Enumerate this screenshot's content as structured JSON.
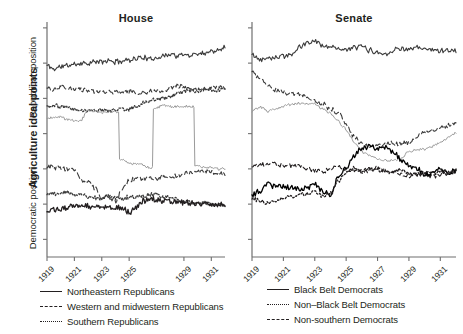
{
  "figure": {
    "y_axis_title": "Agriculture ideal points",
    "y_axis_sub_upper": "Republican position",
    "y_axis_sub_lower": "Democratic position"
  },
  "panels": [
    {
      "id": "house",
      "title": "House",
      "x_tick_labels": [
        "1919",
        "1921",
        "1923",
        "1925",
        "1929",
        "1931"
      ],
      "x_tick_values": [
        1919,
        1921,
        1923,
        1925,
        1929,
        1931
      ]
    },
    {
      "id": "senate",
      "title": "Senate",
      "x_tick_labels": [
        "1919",
        "1921",
        "1923",
        "1925",
        "1927",
        "1929",
        "1931"
      ],
      "x_tick_values": [
        1919,
        1921,
        1923,
        1925,
        1927,
        1929,
        1931
      ]
    }
  ],
  "legends": {
    "left": [
      {
        "label": "Northeastern Republicans",
        "style": "solid",
        "key": "lk-solid"
      },
      {
        "label": "Western and midwestern Republicans",
        "style": "dashed",
        "key": "lk-dashed"
      },
      {
        "label": "Southern Republicans",
        "style": "dotted",
        "key": "lk-dotted"
      }
    ],
    "right": [
      {
        "label": "Black Belt Democrats",
        "style": "solid",
        "key": "lk-solid"
      },
      {
        "label": "Non–Black Belt Democrats",
        "style": "dotted",
        "key": "lk-dotted"
      },
      {
        "label": "Non-southern Democrats",
        "style": "dashed",
        "key": "lk-dashed"
      }
    ]
  },
  "colors": {
    "ink": "#231f20",
    "gray_line": "#9a9a9a",
    "axis": "#6f6f6f",
    "background": "#ffffff"
  },
  "chart_data": {
    "type": "line",
    "title": "Agriculture ideal points",
    "xlabel": "",
    "ylabel": "Agriculture ideal points",
    "grid": false,
    "legend_position": "bottom",
    "xlim": [
      1919,
      1932
    ],
    "ylim": [
      -1.0,
      1.0
    ],
    "y_tick_values": [
      0.95,
      0.65,
      0.35,
      0.05,
      -0.25,
      -0.55,
      -0.85
    ],
    "panels": [
      {
        "name": "House",
        "x": [
          1919,
          1919.5,
          1920,
          1920.5,
          1921,
          1921.5,
          1922,
          1922.5,
          1923,
          1923.5,
          1924,
          1924.5,
          1925,
          1925.5,
          1926,
          1926.5,
          1927,
          1927.5,
          1928,
          1928.5,
          1929,
          1929.5,
          1930,
          1930.5,
          1931,
          1931.5,
          1932
        ],
        "series": [
          {
            "name": "Northeastern Republicans",
            "style": "solid",
            "color": "#3b3b3b",
            "region": "Republican position",
            "values": [
              0.63,
              0.6,
              0.62,
              0.63,
              0.64,
              0.65,
              0.65,
              0.66,
              0.66,
              0.67,
              0.66,
              0.67,
              0.68,
              0.69,
              0.7,
              0.68,
              0.7,
              0.71,
              0.73,
              0.71,
              0.72,
              0.72,
              0.73,
              0.74,
              0.75,
              0.77,
              0.79
            ]
          },
          {
            "name": "Western and midwestern Republicans",
            "style": "dashed",
            "color": "#3b3b3b",
            "region": "Republican position",
            "values": [
              0.44,
              0.42,
              0.45,
              0.43,
              0.43,
              0.42,
              0.42,
              0.41,
              0.4,
              0.41,
              0.4,
              0.4,
              0.41,
              0.4,
              0.4,
              0.41,
              0.41,
              0.42,
              0.44,
              0.46,
              0.44,
              0.43,
              0.43,
              0.43,
              0.44,
              0.44,
              0.44
            ]
          },
          {
            "name": "Southern Republicans",
            "style": "dotted",
            "color": "#3b3b3b",
            "region": "Republican position",
            "values": [
              0.28,
              0.29,
              0.28,
              0.27,
              0.26,
              0.25,
              0.25,
              0.25,
              0.25,
              0.24,
              0.25,
              0.26,
              0.26,
              0.28,
              0.31,
              0.33,
              0.34,
              0.35,
              0.36,
              0.39,
              0.41,
              0.41,
              0.41,
              0.42,
              0.42,
              0.42,
              0.42
            ]
          },
          {
            "name": "Unlabeled gray series",
            "style": "solid",
            "color": "#9a9a9a",
            "region": "Republican position",
            "values": [
              0.18,
              0.19,
              0.19,
              0.17,
              0.16,
              0.16,
              0.26,
              0.24,
              0.23,
              0.23,
              0.24,
              -0.17,
              -0.2,
              -0.21,
              -0.22,
              -0.24,
              0.27,
              0.29,
              0.28,
              0.28,
              0.28,
              0.28,
              -0.22,
              -0.24,
              -0.24,
              -0.25,
              -0.25
            ]
          },
          {
            "name": "Non-southern Democrats",
            "style": "dashed",
            "color": "#3b3b3b",
            "region": "Democratic position",
            "values": [
              -0.23,
              -0.24,
              -0.24,
              -0.25,
              -0.26,
              -0.34,
              -0.36,
              -0.41,
              -0.51,
              -0.48,
              -0.52,
              -0.42,
              -0.35,
              -0.33,
              -0.33,
              -0.33,
              -0.33,
              -0.32,
              -0.32,
              -0.31,
              -0.29,
              -0.28,
              -0.27,
              -0.27,
              -0.28,
              -0.29,
              -0.29
            ]
          },
          {
            "name": "Non-Black Belt Democrats",
            "style": "dotted",
            "color": "#3b3b3b",
            "region": "Democratic position",
            "values": [
              -0.46,
              -0.46,
              -0.46,
              -0.45,
              -0.47,
              -0.47,
              -0.49,
              -0.5,
              -0.5,
              -0.49,
              -0.5,
              -0.5,
              -0.49,
              -0.49,
              -0.48,
              -0.47,
              -0.47,
              -0.49,
              -0.5,
              -0.51,
              -0.53,
              -0.53,
              -0.54,
              -0.54,
              -0.55,
              -0.55,
              -0.56
            ]
          },
          {
            "name": "Black Belt Democrats",
            "style": "solid",
            "color": "#231f20",
            "region": "Democratic position",
            "values": [
              -0.6,
              -0.6,
              -0.59,
              -0.58,
              -0.57,
              -0.56,
              -0.57,
              -0.56,
              -0.57,
              -0.57,
              -0.58,
              -0.59,
              -0.62,
              -0.58,
              -0.52,
              -0.51,
              -0.51,
              -0.52,
              -0.53,
              -0.53,
              -0.54,
              -0.54,
              -0.55,
              -0.55,
              -0.56,
              -0.56,
              -0.56
            ]
          }
        ]
      },
      {
        "name": "Senate",
        "x": [
          1919,
          1919.5,
          1920,
          1920.5,
          1921,
          1921.5,
          1922,
          1922.5,
          1923,
          1923.5,
          1924,
          1924.5,
          1925,
          1925.5,
          1926,
          1926.5,
          1927,
          1927.5,
          1928,
          1928.5,
          1929,
          1929.5,
          1930,
          1930.5,
          1931,
          1931.5,
          1932
        ],
        "series": [
          {
            "name": "Northeastern Republicans",
            "style": "solid",
            "color": "#3b3b3b",
            "region": "Republican position",
            "values": [
              0.72,
              0.68,
              0.7,
              0.7,
              0.71,
              0.72,
              0.78,
              0.82,
              0.84,
              0.8,
              0.79,
              0.78,
              0.76,
              0.78,
              0.79,
              0.76,
              0.74,
              0.73,
              0.76,
              0.78,
              0.76,
              0.78,
              0.77,
              0.76,
              0.76,
              0.76,
              0.76
            ]
          },
          {
            "name": "Western and midwestern Republicans",
            "style": "dashed",
            "color": "#3b3b3b",
            "region": "Republican position",
            "values": [
              0.58,
              0.52,
              0.46,
              0.42,
              0.4,
              0.39,
              0.38,
              0.36,
              0.32,
              0.3,
              0.26,
              0.22,
              0.14,
              0.02,
              -0.04,
              -0.06,
              -0.06,
              -0.04,
              -0.03,
              -0.04,
              -0.02,
              0.02,
              0.06,
              0.08,
              0.1,
              0.12,
              0.14
            ]
          },
          {
            "name": "Unlabeled gray series",
            "style": "solid",
            "color": "#9a9a9a",
            "region": "Republican position",
            "values": [
              0.24,
              0.28,
              0.24,
              0.26,
              0.28,
              0.3,
              0.31,
              0.3,
              0.3,
              0.26,
              0.22,
              0.16,
              0.08,
              -0.02,
              -0.1,
              -0.14,
              -0.16,
              -0.18,
              -0.18,
              -0.16,
              -0.1,
              -0.09,
              -0.08,
              -0.06,
              -0.02,
              0.02,
              0.06
            ]
          },
          {
            "name": "Non-southern Democrats",
            "style": "dashed",
            "color": "#231f20",
            "region": "Democratic position",
            "values": [
              -0.22,
              -0.21,
              -0.22,
              -0.21,
              -0.22,
              -0.22,
              -0.23,
              -0.24,
              -0.26,
              -0.27,
              -0.25,
              -0.22,
              -0.26,
              -0.24,
              -0.28,
              -0.26,
              -0.24,
              -0.26,
              -0.28,
              -0.3,
              -0.31,
              -0.3,
              -0.3,
              -0.31,
              -0.3,
              -0.29,
              -0.27
            ]
          },
          {
            "name": "Black Belt Democrats",
            "style": "solid",
            "color": "#000000",
            "region": "Democratic position",
            "values": [
              -0.48,
              -0.44,
              -0.38,
              -0.4,
              -0.4,
              -0.41,
              -0.42,
              -0.41,
              -0.38,
              -0.44,
              -0.48,
              -0.32,
              -0.24,
              -0.14,
              -0.08,
              -0.06,
              -0.08,
              -0.06,
              -0.1,
              -0.18,
              -0.22,
              -0.24,
              -0.3,
              -0.28,
              -0.26,
              -0.28,
              -0.26
            ]
          },
          {
            "name": "Non-Black Belt Democrats",
            "style": "dotted",
            "color": "#231f20",
            "region": "Democratic position",
            "values": [
              -0.5,
              -0.52,
              -0.54,
              -0.52,
              -0.5,
              -0.48,
              -0.47,
              -0.46,
              -0.44,
              -0.48,
              -0.46,
              -0.36,
              -0.28,
              -0.26,
              -0.26,
              -0.25,
              -0.26,
              -0.27,
              -0.28,
              -0.26,
              -0.29,
              -0.3,
              -0.28,
              -0.29,
              -0.28,
              -0.27,
              -0.27
            ]
          }
        ]
      }
    ]
  }
}
